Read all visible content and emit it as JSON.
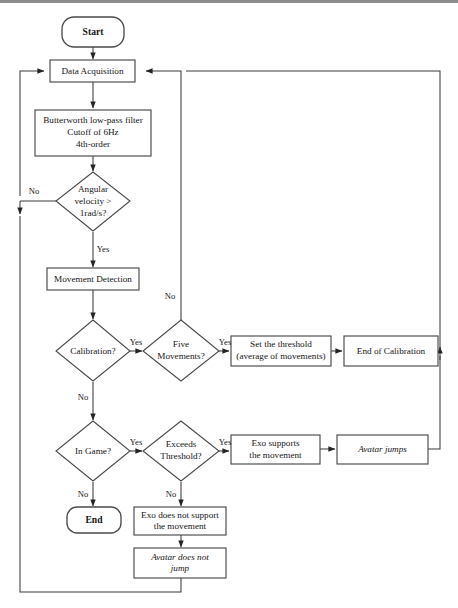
{
  "diagram": {
    "type": "flowchart",
    "canvas": {
      "width": 458,
      "height": 608
    },
    "colors": {
      "background": "#ffffff",
      "shape_stroke": "#4a4a4a",
      "edge_stroke": "#3b3b3b",
      "text": "#151515"
    }
  },
  "nodes": {
    "start": {
      "label": "Start",
      "shape": "terminator"
    },
    "data_acquisition": {
      "label": "Data Acquisition",
      "shape": "process"
    },
    "filter": {
      "line1": "Butterworth low-pass filter",
      "line2": "Cutoff of 6Hz",
      "line3": "4th-order",
      "shape": "process"
    },
    "angular_velocity": {
      "line1": "Angular",
      "line2": "velocity >",
      "line3": "1rad/s?",
      "shape": "decision"
    },
    "movement_detection": {
      "label": "Movement Detection",
      "shape": "process"
    },
    "calibration": {
      "label": "Calibration?",
      "shape": "decision"
    },
    "five_movements": {
      "line1": "Five",
      "line2": "Movements?",
      "shape": "decision"
    },
    "set_threshold": {
      "line1": "Set the threshold",
      "line2": "(average of movements)",
      "shape": "process"
    },
    "end_of_calibration": {
      "label": "End of Calibration",
      "shape": "process"
    },
    "in_game": {
      "label": "In Game?",
      "shape": "decision"
    },
    "exceeds_threshold": {
      "line1": "Exceeds",
      "line2": "Threshold?",
      "shape": "decision"
    },
    "exo_supports": {
      "line1": "Exo supports",
      "line2": "the movement",
      "shape": "process"
    },
    "avatar_jumps": {
      "label": "Avatar jumps",
      "shape": "process"
    },
    "end": {
      "label": "End",
      "shape": "terminator"
    },
    "exo_not_support": {
      "line1": "Exo does not support",
      "line2": "the movement",
      "shape": "process"
    },
    "avatar_not_jump": {
      "line1": "Avatar does not",
      "line2": "jump",
      "shape": "process"
    }
  },
  "edge_labels": {
    "angular_no": "No",
    "angular_yes": "Yes",
    "five_movements_no": "No",
    "calibration_yes": "Yes",
    "calibration_no": "No",
    "five_movements_yes": "Yes",
    "in_game_yes": "Yes",
    "in_game_no": "No",
    "exceeds_yes": "Yes",
    "exceeds_no": "No"
  }
}
